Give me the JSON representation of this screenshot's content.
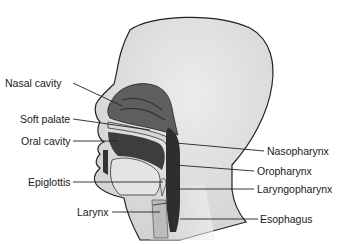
{
  "diagram": {
    "type": "anatomical-sagittal-section",
    "labels_left": [
      {
        "id": "nasal-cavity",
        "text": "Nasal cavity"
      },
      {
        "id": "soft-palate",
        "text": "Soft palate"
      },
      {
        "id": "oral-cavity",
        "text": "Oral cavity"
      },
      {
        "id": "epiglottis",
        "text": "Epiglottis"
      },
      {
        "id": "larynx",
        "text": "Larynx"
      }
    ],
    "labels_right": [
      {
        "id": "nasopharynx",
        "text": "Nasopharynx"
      },
      {
        "id": "oropharynx",
        "text": "Oropharynx"
      },
      {
        "id": "laryngopharynx",
        "text": "Laryngopharynx"
      },
      {
        "id": "esophagus",
        "text": "Esophagus"
      }
    ],
    "colors": {
      "background": "#ffffff",
      "head_fill": "#e2e2e2",
      "outline": "#222222",
      "cavity_dark": "#3a3a3a",
      "cavity_mid": "#6a6a6a",
      "palate_light": "#d8d8d8",
      "leader_line": "#222222",
      "label_text": "#1a1a1a"
    }
  }
}
